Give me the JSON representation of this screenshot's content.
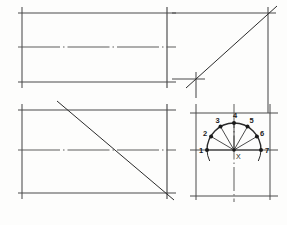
{
  "drawing": {
    "title": "Orthographic projection construction",
    "background_color": "#fdfdfc",
    "line_color": "#4a4a4a",
    "dark_line_color": "#2b2b2b",
    "center_line_color": "#555555",
    "views": {
      "top_left": {
        "name": "plan-view-upper",
        "type": "rectangle-with-centerline",
        "rect": {
          "x": 22,
          "y": 13,
          "width": 145,
          "height": 69
        },
        "centerline_y": 47,
        "has_diagonal": false
      },
      "bottom_left": {
        "name": "plan-view-lower",
        "type": "rectangle-with-centerline-and-diagonal",
        "rect": {
          "x": 22,
          "y": 110,
          "width": 145,
          "height": 83
        },
        "centerline_y": 150,
        "diagonal": {
          "x1": 57,
          "y1": 101,
          "x2": 172,
          "y2": 198
        }
      },
      "top_right": {
        "name": "projection-mitre-view",
        "type": "corner-with-45-degree-line",
        "vertical_x": 268,
        "horizontal_y": 79,
        "corner_x": 196,
        "diagonal": {
          "x1": 186,
          "y1": 88,
          "x2": 276,
          "y2": 6
        }
      },
      "bottom_right": {
        "name": "semicircle-arch-view",
        "type": "semicircle-with-divisions",
        "center": {
          "x": 234,
          "y": 150
        },
        "center_label": "X",
        "radius": 27,
        "rect": {
          "x": 196,
          "y": 113,
          "width": 74,
          "height": 83
        },
        "division_points": [
          {
            "label": "1",
            "x": 207,
            "y": 150,
            "label_dx": -8,
            "label_dy": 3
          },
          {
            "label": "2",
            "x": 211.1,
            "y": 136.5,
            "label_dx": -8,
            "label_dy": -1
          },
          {
            "label": "3",
            "x": 220.5,
            "y": 126.6,
            "label_dx": -5,
            "label_dy": -4
          },
          {
            "label": "4",
            "x": 234,
            "y": 123,
            "label_dx": -1,
            "label_dy": -5
          },
          {
            "label": "5",
            "x": 247.5,
            "y": 126.6,
            "label_dx": 2,
            "label_dy": -4
          },
          {
            "label": "6",
            "x": 256.9,
            "y": 136.5,
            "label_dx": 3,
            "label_dy": -1
          },
          {
            "label": "7",
            "x": 261,
            "y": 150,
            "label_dx": 4,
            "label_dy": 3
          }
        ]
      }
    }
  }
}
